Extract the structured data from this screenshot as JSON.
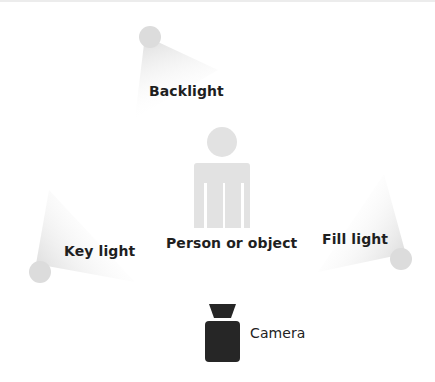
{
  "diagram": {
    "labels": {
      "backlight": "Backlight",
      "subject": "Person or object",
      "key_light": "Key light",
      "fill_light": "Fill light",
      "camera": "Camera"
    },
    "colors": {
      "light_source": "#dcdcdc",
      "light_beam": "#e6e6e6",
      "subject": "#e2e2e2",
      "camera": "#262626",
      "text": "#1f1f1f"
    },
    "icons": {
      "backlight": "light-source-circle",
      "key_light": "light-source-circle",
      "fill_light": "light-source-circle",
      "subject": "person-icon",
      "camera": "camera-icon"
    }
  }
}
